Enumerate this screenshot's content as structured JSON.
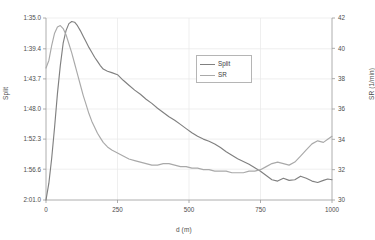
{
  "chart_data": {
    "type": "line",
    "title": "",
    "xlabel": "d (m)",
    "ylabel_left": "Split",
    "ylabel_right": "SR (1/min)",
    "grid": true,
    "legend_position": "inside-top-center",
    "x": [
      0,
      10,
      20,
      30,
      40,
      50,
      60,
      70,
      80,
      90,
      100,
      110,
      120,
      130,
      140,
      150,
      160,
      170,
      180,
      190,
      200,
      215,
      230,
      250,
      270,
      290,
      310,
      330,
      350,
      370,
      390,
      410,
      430,
      450,
      470,
      490,
      510,
      530,
      550,
      570,
      590,
      610,
      630,
      650,
      670,
      690,
      710,
      730,
      750,
      770,
      790,
      810,
      830,
      850,
      870,
      890,
      910,
      930,
      950,
      970,
      985,
      1000
    ],
    "xlim": [
      0,
      1000
    ],
    "xticks": [
      0,
      250,
      500,
      750,
      1000
    ],
    "ylim_left_seconds": [
      95.0,
      121.0
    ],
    "ylim_left_labels": [
      "1:35.0",
      "1:39.4",
      "1:43.7",
      "1:48.0",
      "1:52.3",
      "1:56.6",
      "2:01.0"
    ],
    "yticks_left_seconds": [
      95.0,
      99.4,
      103.7,
      108.0,
      112.3,
      116.6,
      121.0
    ],
    "ylim_right": [
      30,
      42
    ],
    "yticks_right": [
      30,
      32,
      34,
      36,
      38,
      40,
      42
    ],
    "series": [
      {
        "name": "Split",
        "color": "#808080",
        "axis": "left",
        "unit": "seconds",
        "values": [
          121.0,
          118.6,
          115.0,
          110.6,
          105.8,
          101.8,
          98.6,
          96.8,
          95.8,
          95.5,
          95.6,
          96.1,
          96.8,
          97.6,
          98.4,
          99.2,
          99.9,
          100.6,
          101.2,
          101.8,
          102.3,
          102.6,
          102.8,
          103.1,
          103.9,
          104.6,
          105.3,
          105.9,
          106.6,
          107.2,
          107.9,
          108.5,
          109.1,
          109.6,
          110.2,
          110.8,
          111.4,
          111.9,
          112.3,
          112.6,
          113.0,
          113.5,
          114.1,
          114.6,
          115.1,
          115.5,
          115.9,
          116.4,
          116.9,
          117.5,
          118.1,
          118.3,
          117.9,
          118.2,
          118.1,
          117.6,
          117.9,
          118.3,
          118.5,
          118.2,
          118.0,
          118.1
        ]
      },
      {
        "name": "SR",
        "color": "#a9a9a9",
        "axis": "right",
        "unit": "1/min",
        "values": [
          38.7,
          39.2,
          40.2,
          41.0,
          41.4,
          41.5,
          41.3,
          40.9,
          40.3,
          39.7,
          39.0,
          38.3,
          37.6,
          36.9,
          36.3,
          35.7,
          35.2,
          34.8,
          34.4,
          34.1,
          33.8,
          33.5,
          33.3,
          33.1,
          32.9,
          32.7,
          32.6,
          32.5,
          32.4,
          32.3,
          32.3,
          32.4,
          32.4,
          32.3,
          32.2,
          32.2,
          32.1,
          32.1,
          32.0,
          32.0,
          31.9,
          31.9,
          31.9,
          31.8,
          31.8,
          31.8,
          31.9,
          31.9,
          32.0,
          32.2,
          32.4,
          32.5,
          32.4,
          32.3,
          32.5,
          32.9,
          33.3,
          33.7,
          33.9,
          33.8,
          34.0,
          34.2
        ]
      }
    ],
    "legend": [
      {
        "label": "Split",
        "color": "#808080"
      },
      {
        "label": "SR",
        "color": "#a9a9a9"
      }
    ]
  }
}
